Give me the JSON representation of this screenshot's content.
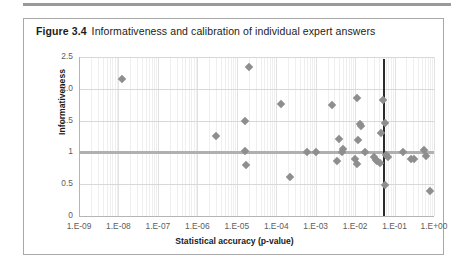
{
  "page": {
    "top_rule": "page-rule"
  },
  "figure": {
    "number": "Figure 3.4",
    "caption": "Informativeness and calibration of individual expert answers"
  },
  "chart_data": {
    "type": "scatter",
    "title": "Informativeness and calibration of individual expert answers",
    "xlabel": "Statistical accuracy (p-value)",
    "ylabel": "Informativeness",
    "x_scale": "log",
    "x_tick_labels": [
      "1.E-09",
      "1.E-08",
      "1.E-07",
      "1.E-06",
      "1.E-05",
      "1.E-04",
      "1.E-03",
      "1.E-02",
      "1.E-01",
      "1.E+00"
    ],
    "x_tick_values": [
      1e-09,
      1e-08,
      1e-07,
      1e-06,
      1e-05,
      0.0001,
      0.001,
      0.01,
      0.1,
      1
    ],
    "xlim": [
      1e-09,
      1
    ],
    "y_tick_labels": [
      "0",
      "0.5",
      "1",
      "1.5",
      "2.0",
      "2.5"
    ],
    "y_tick_values": [
      0,
      0.5,
      1,
      1.5,
      2.0,
      2.5
    ],
    "ylim": [
      0,
      2.5
    ],
    "grid": "y-major-and-x-log-minor",
    "legend": "none",
    "marker": "diamond",
    "marker_color": "#8e8e8e",
    "reference_lines": [
      {
        "name": "informativeness-unity-line",
        "orientation": "horizontal",
        "y": 1.0,
        "color": "#b0b0b0"
      },
      {
        "name": "significance-threshold-line",
        "orientation": "vertical",
        "x": 0.05,
        "color": "#2b2b2b"
      }
    ],
    "points": [
      {
        "x": 1.2e-08,
        "y": 2.16
      },
      {
        "x": 2e-05,
        "y": 2.34
      },
      {
        "x": 3e-06,
        "y": 1.26
      },
      {
        "x": 1.6e-05,
        "y": 1.5
      },
      {
        "x": 1.6e-05,
        "y": 1.02
      },
      {
        "x": 1.7e-05,
        "y": 0.8
      },
      {
        "x": 0.00013,
        "y": 1.76
      },
      {
        "x": 0.0006,
        "y": 1.0
      },
      {
        "x": 0.00022,
        "y": 0.62
      },
      {
        "x": 0.001,
        "y": 1.0
      },
      {
        "x": 0.0026,
        "y": 1.74
      },
      {
        "x": 0.0046,
        "y": 1.0
      },
      {
        "x": 0.004,
        "y": 1.21
      },
      {
        "x": 0.005,
        "y": 1.05
      },
      {
        "x": 0.0034,
        "y": 0.86
      },
      {
        "x": 0.011,
        "y": 1.86
      },
      {
        "x": 0.013,
        "y": 1.44
      },
      {
        "x": 0.014,
        "y": 1.42
      },
      {
        "x": 0.012,
        "y": 1.2
      },
      {
        "x": 0.01,
        "y": 0.9
      },
      {
        "x": 0.011,
        "y": 0.82
      },
      {
        "x": 0.018,
        "y": 1.0
      },
      {
        "x": 0.03,
        "y": 0.92
      },
      {
        "x": 0.033,
        "y": 0.88
      },
      {
        "x": 0.036,
        "y": 0.86
      },
      {
        "x": 0.042,
        "y": 0.84
      },
      {
        "x": 0.052,
        "y": 1.82
      },
      {
        "x": 0.056,
        "y": 1.46
      },
      {
        "x": 0.046,
        "y": 1.3
      },
      {
        "x": 0.06,
        "y": 0.96
      },
      {
        "x": 0.07,
        "y": 0.92
      },
      {
        "x": 0.058,
        "y": 0.48
      },
      {
        "x": 0.16,
        "y": 1.0
      },
      {
        "x": 0.26,
        "y": 0.9
      },
      {
        "x": 0.32,
        "y": 0.9
      },
      {
        "x": 0.56,
        "y": 1.04
      },
      {
        "x": 0.62,
        "y": 0.94
      },
      {
        "x": 0.78,
        "y": 0.4
      }
    ]
  }
}
